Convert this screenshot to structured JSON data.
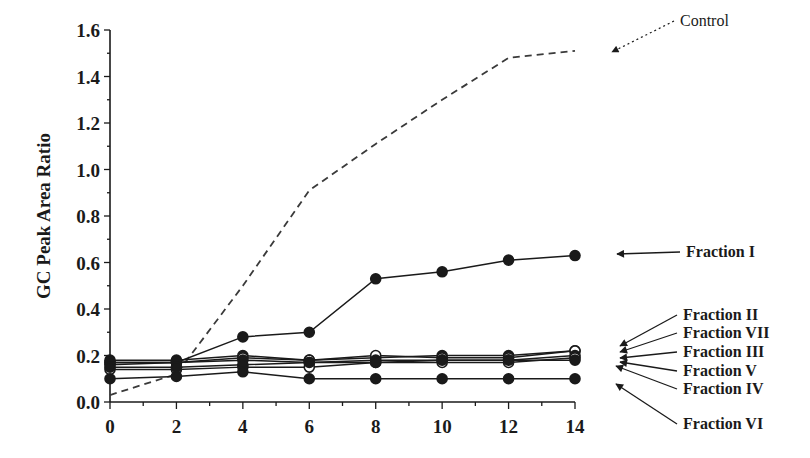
{
  "chart_data": {
    "type": "line",
    "title": "",
    "xlabel": "",
    "ylabel": "GC Peak Area Ratio",
    "xlim": [
      0,
      14
    ],
    "ylim": [
      0.0,
      1.6
    ],
    "grid": false,
    "legend_position": "inline-right-annotations",
    "x": [
      0,
      2,
      4,
      6,
      8,
      10,
      12,
      14
    ],
    "x_tick_labels": [
      "0",
      "2",
      "4",
      "6",
      "8",
      "10",
      "12",
      "14"
    ],
    "y_tick_labels": [
      "0.0",
      "0.2",
      "0.4",
      "0.6",
      "0.8",
      "1.0",
      "1.2",
      "1.4",
      "1.6"
    ],
    "series": [
      {
        "name": "Control",
        "marker": "none",
        "line": "dashed",
        "values": [
          0.03,
          0.12,
          0.5,
          0.91,
          1.11,
          1.3,
          1.48,
          1.51
        ]
      },
      {
        "name": "Fraction I",
        "marker": "filled",
        "line": "solid",
        "values": [
          0.16,
          0.17,
          0.28,
          0.3,
          0.53,
          0.56,
          0.61,
          0.63
        ]
      },
      {
        "name": "Fraction II",
        "marker": "filled",
        "line": "solid",
        "values": [
          0.18,
          0.18,
          0.2,
          0.18,
          0.19,
          0.2,
          0.2,
          0.22
        ]
      },
      {
        "name": "Fraction VII",
        "marker": "open",
        "line": "solid",
        "values": [
          0.17,
          0.17,
          0.19,
          0.18,
          0.2,
          0.19,
          0.19,
          0.22
        ]
      },
      {
        "name": "Fraction III",
        "marker": "filled",
        "line": "solid",
        "values": [
          0.17,
          0.17,
          0.18,
          0.17,
          0.18,
          0.18,
          0.18,
          0.2
        ]
      },
      {
        "name": "Fraction V",
        "marker": "open",
        "line": "solid",
        "values": [
          0.14,
          0.14,
          0.15,
          0.15,
          0.17,
          0.17,
          0.17,
          0.19
        ]
      },
      {
        "name": "Fraction IV",
        "marker": "filled",
        "line": "solid",
        "values": [
          0.15,
          0.15,
          0.16,
          0.17,
          0.17,
          0.18,
          0.18,
          0.18
        ]
      },
      {
        "name": "Fraction VI",
        "marker": "filled",
        "line": "solid",
        "values": [
          0.1,
          0.11,
          0.13,
          0.1,
          0.1,
          0.1,
          0.1,
          0.1
        ]
      }
    ],
    "annotations": [
      {
        "text": "Control",
        "label_x": 680,
        "label_y": 26,
        "arrow_to_x": 612,
        "arrow_to_y": 52,
        "dotted": true,
        "bold": false
      },
      {
        "text": "Fraction I",
        "label_x": 686,
        "label_y": 257,
        "arrow_to_x": 617,
        "arrow_to_y": 254,
        "dotted": false,
        "bold": true
      },
      {
        "text": "Fraction II",
        "label_x": 683,
        "label_y": 320,
        "arrow_to_x": 620,
        "arrow_to_y": 346,
        "dotted": false,
        "bold": true
      },
      {
        "text": "Fraction VII",
        "label_x": 683,
        "label_y": 338,
        "arrow_to_x": 620,
        "arrow_to_y": 352,
        "dotted": false,
        "bold": true
      },
      {
        "text": "Fraction III",
        "label_x": 683,
        "label_y": 357,
        "arrow_to_x": 620,
        "arrow_to_y": 358,
        "dotted": false,
        "bold": true
      },
      {
        "text": "Fraction V",
        "label_x": 683,
        "label_y": 376,
        "arrow_to_x": 620,
        "arrow_to_y": 362,
        "dotted": false,
        "bold": true
      },
      {
        "text": "Fraction IV",
        "label_x": 683,
        "label_y": 394,
        "arrow_to_x": 616,
        "arrow_to_y": 366,
        "dotted": false,
        "bold": true
      },
      {
        "text": "Fraction VI",
        "label_x": 683,
        "label_y": 429,
        "arrow_to_x": 616,
        "arrow_to_y": 384,
        "dotted": false,
        "bold": true
      }
    ]
  },
  "colors": {
    "ink": "#1a1a1a",
    "control_line": "#3a3a3a",
    "background": "#ffffff"
  }
}
